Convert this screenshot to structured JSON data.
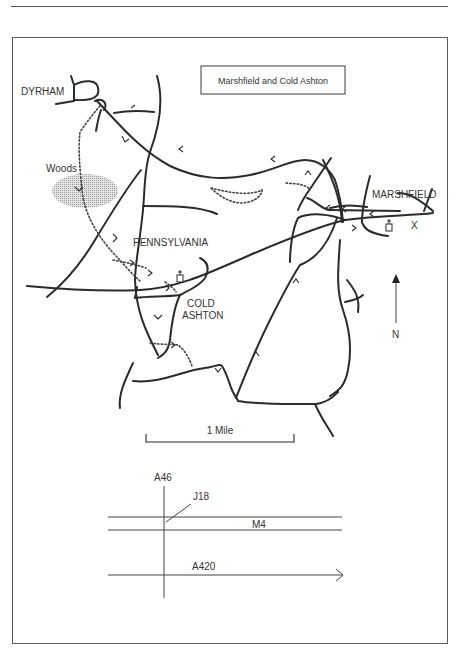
{
  "map": {
    "title": "Marshfield and Cold Ashton",
    "places": {
      "dyrham": "DYRHAM",
      "woods": "Woods",
      "marshfield": "MARSHFIELD",
      "pennsylvania": "PENNSYLVANIA",
      "cold": "COLD",
      "ashton": "ASHTON"
    },
    "markers": {
      "start_marker": "X"
    },
    "north_label": "N",
    "scale_label": "1 Mile",
    "icons": [
      "church-icon",
      "church-icon",
      "north-arrow-icon",
      "woods-shading"
    ]
  },
  "locator": {
    "roads": {
      "a46": "A46",
      "j18": "J18",
      "m4": "M4",
      "a420": "A420"
    }
  },
  "colors": {
    "line": "#2b2b2b",
    "woods_fill": "#c8c8c8",
    "frame": "#5a5a5a"
  }
}
